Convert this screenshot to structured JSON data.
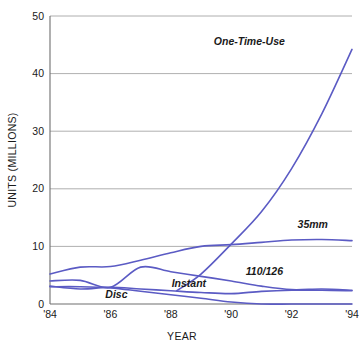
{
  "chart_data": {
    "type": "line",
    "title": "",
    "xlabel": "YEAR",
    "ylabel": "UNITS (MILLIONS)",
    "x": [
      1984,
      1985,
      1986,
      1987,
      1988,
      1989,
      1990,
      1991,
      1992,
      1993,
      1994
    ],
    "xtick_labels": [
      "'84",
      "'86",
      "'88",
      "'90",
      "'92",
      "'94"
    ],
    "xtick_values": [
      1984,
      1986,
      1988,
      1990,
      1992,
      1994
    ],
    "ytick_labels": [
      "0",
      "10",
      "20",
      "30",
      "40",
      "50"
    ],
    "ytick_values": [
      0,
      10,
      20,
      30,
      40,
      50
    ],
    "xlim": [
      1984,
      1994
    ],
    "ylim": [
      0,
      50
    ],
    "grid": true,
    "legend_position": "inline-labels",
    "line_color": "#5b5bc4",
    "grid_color": "#9a9a9a",
    "axis_color": "#6e6e6e",
    "background": "#ffffff",
    "series": [
      {
        "name": "One-Time-Use",
        "label": "One-Time-Use",
        "label_x": 1990.6,
        "label_y": 45.0,
        "x": [
          1988.2,
          1989,
          1990,
          1991,
          1992,
          1993,
          1994
        ],
        "values": [
          2.3,
          5.2,
          10.4,
          16.0,
          23.5,
          33.0,
          44.2
        ]
      },
      {
        "name": "35mm",
        "label": "35mm",
        "label_x": 1992.7,
        "label_y": 13.2,
        "x": [
          1984,
          1985,
          1986,
          1987,
          1988,
          1989,
          1990,
          1991,
          1992,
          1993,
          1994
        ],
        "values": [
          5.2,
          6.4,
          6.5,
          7.6,
          8.9,
          10.0,
          10.3,
          10.7,
          11.1,
          11.2,
          11.0
        ]
      },
      {
        "name": "110/126",
        "label": "110/126",
        "label_x": 1991.1,
        "label_y": 5.0,
        "x": [
          1984,
          1985,
          1986,
          1987,
          1988,
          1989,
          1990,
          1991,
          1992,
          1993,
          1994
        ],
        "values": [
          4.0,
          4.1,
          2.9,
          6.4,
          5.6,
          4.8,
          4.0,
          3.1,
          2.5,
          2.6,
          2.4
        ]
      },
      {
        "name": "Instant",
        "label": "Instant",
        "label_x": 1988.6,
        "label_y": 3.0,
        "x": [
          1984,
          1985,
          1986,
          1987,
          1988,
          1989,
          1990,
          1991,
          1992,
          1993,
          1994
        ],
        "values": [
          3.1,
          2.6,
          2.9,
          2.6,
          2.3,
          2.0,
          1.8,
          2.2,
          2.4,
          2.4,
          2.3
        ]
      },
      {
        "name": "Disc",
        "label": "Disc",
        "label_x": 1986.2,
        "label_y": 1.1,
        "x": [
          1984,
          1985,
          1986,
          1987,
          1988,
          1989,
          1990,
          1991,
          1992,
          1993,
          1994
        ],
        "values": [
          3.0,
          3.0,
          2.8,
          2.2,
          1.6,
          1.0,
          0.35,
          0.0,
          0.0,
          0.0,
          0.0
        ]
      }
    ]
  }
}
